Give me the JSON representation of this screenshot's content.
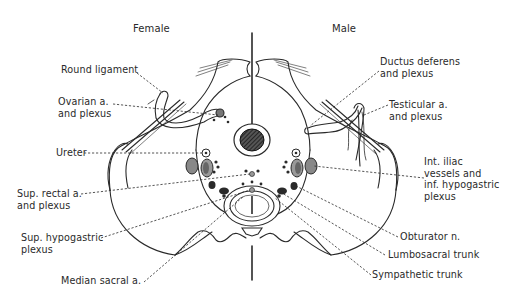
{
  "figure": {
    "sides": {
      "left": "Female",
      "right": "Male"
    },
    "labels": {
      "round_ligament": [
        "Round ligament"
      ],
      "ovarian_a": [
        "Ovarian a.",
        "and plexus"
      ],
      "ureter": [
        "Ureter"
      ],
      "sup_rectal_a": [
        "Sup. rectal a.",
        "and plexus"
      ],
      "sup_hypogastric": [
        "Sup. hypogastric",
        "plexus"
      ],
      "median_sacral": [
        "Median sacral a."
      ],
      "ductus_deferens": [
        "Ductus deferens",
        "and plexus"
      ],
      "testicular_a": [
        "Testicular a.",
        "and plexus"
      ],
      "int_iliac": [
        "Int. iliac",
        "vessels and",
        "inf. hypogastric",
        "plexus"
      ],
      "obturator": [
        "Obturator n."
      ],
      "lumbosacral": [
        "Lumbosacral trunk"
      ],
      "sympathetic": [
        "Sympathetic trunk"
      ]
    },
    "colors": {
      "ink": "#2a2a2a",
      "background": "#ffffff"
    }
  }
}
